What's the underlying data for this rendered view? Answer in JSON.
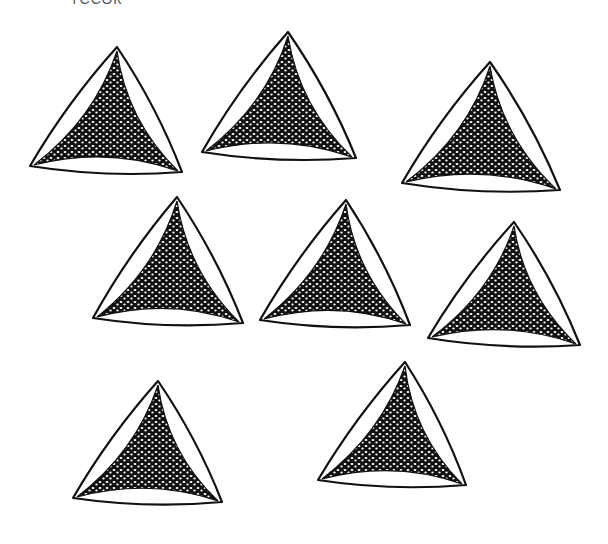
{
  "figure": {
    "top_label_partial": "ТССОК",
    "specimen_count": 8,
    "colors": {
      "ink": "#111111",
      "background": "#ffffff"
    }
  },
  "specimens": [
    {
      "id": 1,
      "top": [
        117,
        47
      ],
      "left": [
        30,
        166
      ],
      "right": [
        182,
        172
      ]
    },
    {
      "id": 2,
      "top": [
        288,
        32
      ],
      "left": [
        202,
        152
      ],
      "right": [
        356,
        158
      ]
    },
    {
      "id": 3,
      "top": [
        490,
        62
      ],
      "left": [
        402,
        183
      ],
      "right": [
        560,
        190
      ]
    },
    {
      "id": 4,
      "top": [
        177,
        197
      ],
      "left": [
        93,
        318
      ],
      "right": [
        243,
        323
      ]
    },
    {
      "id": 5,
      "top": [
        346,
        200
      ],
      "left": [
        260,
        320
      ],
      "right": [
        410,
        325
      ]
    },
    {
      "id": 6,
      "top": [
        514,
        222
      ],
      "left": [
        428,
        338
      ],
      "right": [
        580,
        345
      ]
    },
    {
      "id": 7,
      "top": [
        158,
        381
      ],
      "left": [
        73,
        498
      ],
      "right": [
        222,
        502
      ]
    },
    {
      "id": 8,
      "top": [
        405,
        362
      ],
      "left": [
        318,
        480
      ],
      "right": [
        466,
        485
      ]
    }
  ]
}
